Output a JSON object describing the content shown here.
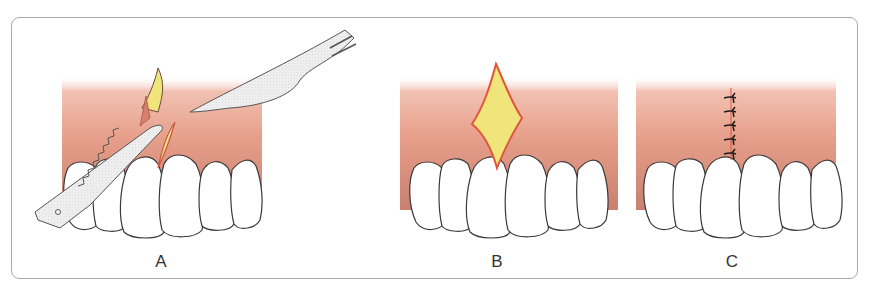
{
  "figure": {
    "panels": [
      {
        "id": "A",
        "label": "A",
        "description": "Incision with scalpel blade and serrated tissue forceps grasping tissue"
      },
      {
        "id": "B",
        "label": "B",
        "description": "Diamond-shaped wound exposing underlying tissue"
      },
      {
        "id": "C",
        "label": "C",
        "description": "Wound closed with five interrupted sutures"
      }
    ],
    "sutures_count": 5,
    "colors": {
      "gum": "#e7a08b",
      "gum_dark": "#c9786a",
      "wound_yellow": "#f0e57a",
      "wound_edge": "#e0553d",
      "tooth": "#ffffff",
      "outline": "#3a3a3a",
      "instrument": "#ececec",
      "suture": "#1e1e1e",
      "frame": "#a9a9a9"
    }
  }
}
